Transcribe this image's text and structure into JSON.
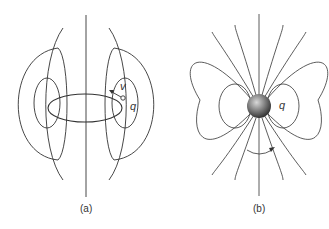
{
  "figure": {
    "panels": [
      {
        "id": "a",
        "caption": "(a)",
        "description": "Magnetic field lines of a charge q moving with velocity v in a circular loop",
        "labels": {
          "velocity": "v",
          "charge": "q"
        }
      },
      {
        "id": "b",
        "caption": "(b)",
        "description": "Magnetic field lines of a spinning charged sphere q (magnetic dipole)",
        "labels": {
          "charge": "q"
        }
      }
    ],
    "colors": {
      "line": "#333333",
      "sphere_light": "#cfcfcf",
      "sphere_dark": "#3a3a3a"
    }
  }
}
